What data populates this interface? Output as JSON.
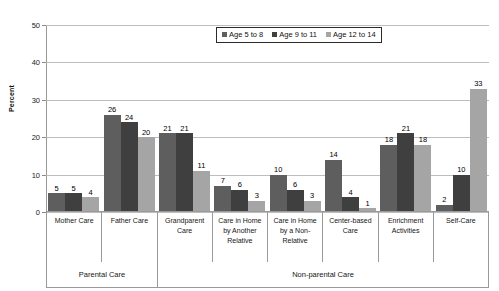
{
  "chart_data": {
    "type": "bar",
    "title": "",
    "xlabel": "",
    "ylabel": "Percent",
    "ylim": [
      0,
      50
    ],
    "yticks": [
      0,
      10,
      20,
      30,
      40,
      50
    ],
    "grid": true,
    "legend_position": "top-center",
    "categories": [
      "Mother Care",
      "Father Care",
      "Grandparent Care",
      "Care in Home by Another Relative",
      "Care in Home by a Non-Relative",
      "Center-based Care",
      "Enrichment Activities",
      "Self-Care"
    ],
    "series": [
      {
        "name": "Age 5 to 8",
        "color": "#5e5e5e",
        "values": [
          5,
          26,
          21,
          7,
          10,
          14,
          18,
          2
        ]
      },
      {
        "name": "Age 9 to 11",
        "color": "#3f3f3f",
        "values": [
          5,
          24,
          21,
          6,
          6,
          4,
          21,
          10
        ]
      },
      {
        "name": "Age 12 to 14",
        "color": "#a5a5a5",
        "values": [
          4,
          20,
          11,
          3,
          3,
          1,
          18,
          33
        ]
      }
    ],
    "group_bands": [
      {
        "label": "Parental Care",
        "span": 2
      },
      {
        "label": "Non-parental Care",
        "span": 6
      }
    ]
  }
}
